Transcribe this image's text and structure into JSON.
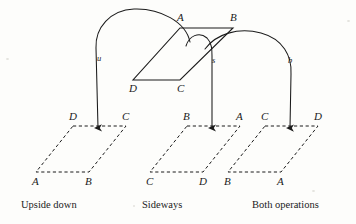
{
  "figure": {
    "stroke_color": "#1b1b1b",
    "background_color": "#fdfdfb"
  },
  "source_shape": {
    "name": "original-parallelogram",
    "style": "solid",
    "vertices": [
      {
        "label": "A",
        "corner": "top-left",
        "x": 180,
        "y": 28,
        "label_x": 177,
        "label_y": 12
      },
      {
        "label": "B",
        "corner": "top-right",
        "x": 233,
        "y": 28,
        "label_x": 230,
        "label_y": 12
      },
      {
        "label": "C",
        "corner": "bottom-right",
        "x": 180,
        "y": 80,
        "label_x": 177,
        "label_y": 83
      },
      {
        "label": "D",
        "corner": "bottom-left",
        "x": 133,
        "y": 80,
        "label_x": 129,
        "label_y": 83
      }
    ]
  },
  "arrows": [
    {
      "name": "arrow-u",
      "label": "u",
      "label_x": 97,
      "label_y": 54,
      "tip_x": 98,
      "tip_y": 137
    },
    {
      "name": "arrow-s",
      "label": "s",
      "label_x": 212,
      "label_y": 56,
      "tip_x": 212,
      "tip_y": 137
    },
    {
      "name": "arrow-b",
      "label": "b",
      "label_x": 288,
      "label_y": 56,
      "tip_x": 290,
      "tip_y": 137
    }
  ],
  "results": [
    {
      "name": "result-upside-down",
      "caption": "Upside down",
      "caption_x": 21,
      "caption_y": 200,
      "style": "dashed",
      "vertices": [
        {
          "label": "D",
          "corner": "top-left",
          "x": 73,
          "y": 126,
          "label_x": 69,
          "label_y": 111
        },
        {
          "label": "C",
          "corner": "top-right",
          "x": 126,
          "y": 126,
          "label_x": 122,
          "label_y": 111
        },
        {
          "label": "B",
          "corner": "bottom-right",
          "x": 89,
          "y": 172,
          "label_x": 85,
          "label_y": 176
        },
        {
          "label": "A",
          "corner": "bottom-left",
          "x": 36,
          "y": 172,
          "label_x": 32,
          "label_y": 176
        }
      ]
    },
    {
      "name": "result-sideways",
      "caption": "Sideways",
      "caption_x": 142,
      "caption_y": 200,
      "style": "dashed",
      "vertices": [
        {
          "label": "B",
          "corner": "top-left",
          "x": 187,
          "y": 126,
          "label_x": 183,
          "label_y": 111
        },
        {
          "label": "A",
          "corner": "top-right",
          "x": 240,
          "y": 126,
          "label_x": 236,
          "label_y": 111
        },
        {
          "label": "D",
          "corner": "bottom-right",
          "x": 203,
          "y": 172,
          "label_x": 199,
          "label_y": 176
        },
        {
          "label": "C",
          "corner": "bottom-left",
          "x": 150,
          "y": 172,
          "label_x": 146,
          "label_y": 176
        }
      ]
    },
    {
      "name": "result-both-operations",
      "caption": "Both operations",
      "caption_x": 252,
      "caption_y": 200,
      "style": "dashed",
      "vertices": [
        {
          "label": "C",
          "corner": "top-left",
          "x": 265,
          "y": 126,
          "label_x": 261,
          "label_y": 111
        },
        {
          "label": "D",
          "corner": "top-right",
          "x": 318,
          "y": 126,
          "label_x": 314,
          "label_y": 111
        },
        {
          "label": "A",
          "corner": "bottom-right",
          "x": 281,
          "y": 172,
          "label_x": 277,
          "label_y": 176
        },
        {
          "label": "B",
          "corner": "bottom-left",
          "x": 228,
          "y": 172,
          "label_x": 224,
          "label_y": 176
        }
      ]
    }
  ]
}
